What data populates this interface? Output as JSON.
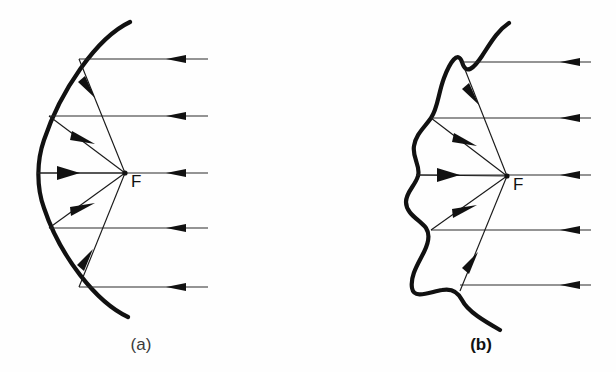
{
  "figure": {
    "background_color": "#fefefe",
    "ink_color": "#111111",
    "width": 616,
    "height": 372
  },
  "panels": [
    {
      "id": "panel-a",
      "caption": "(a)",
      "caption_x": 141,
      "caption_y": 350,
      "caption_bold": false,
      "mirror_type": "smooth-parabolic",
      "mirror_stroke_width": 4.2,
      "focus": {
        "label": "F",
        "x": 125,
        "y": 173,
        "label_x": 131,
        "label_y": 187,
        "dot_radius": 2.6
      },
      "axis_x_left": 37,
      "ray_x_right": 208,
      "arrow_tip_x": 166,
      "rays": [
        {
          "y": 59,
          "hit_x": 79,
          "hit_y": 59
        },
        {
          "y": 116,
          "hit_x": 49,
          "hit_y": 116
        },
        {
          "y": 173,
          "hit_x": 37,
          "hit_y": 173
        },
        {
          "y": 228,
          "hit_x": 49,
          "hit_y": 228
        },
        {
          "y": 287,
          "hit_x": 79,
          "hit_y": 287
        }
      ],
      "curve_path": "M 130 22 C 96 38 60 92 44 140 C 37 160 36 186 44 208 C 60 256 96 302 128 317"
    },
    {
      "id": "panel-b",
      "caption": "(b)",
      "caption_x": 481,
      "caption_y": 350,
      "caption_bold": true,
      "mirror_type": "irregular-wavy",
      "mirror_stroke_width": 4.2,
      "focus": {
        "label": "F",
        "x": 507,
        "y": 176,
        "label_x": 513,
        "label_y": 190,
        "dot_radius": 2.6
      },
      "axis_x_left": 415,
      "ray_x_right": 591,
      "arrow_tip_x": 560,
      "rays": [
        {
          "y": 62,
          "hit_x": 462,
          "hit_y": 62
        },
        {
          "y": 118,
          "hit_x": 431,
          "hit_y": 118
        },
        {
          "y": 175,
          "hit_x": 416,
          "hit_y": 175
        },
        {
          "y": 230,
          "hit_x": 431,
          "hit_y": 230
        },
        {
          "y": 285,
          "hit_x": 460,
          "hit_y": 285
        }
      ],
      "curve_path": "M 509 23 C 497 31 490 44 482 56 C 474 68 466 76 462 62 C 458 50 450 62 444 78 C 438 94 438 108 431 118 C 424 128 416 134 414 146 C 412 158 421 166 418 176 C 415 186 406 192 406 202 C 406 214 420 220 426 228 C 430 234 429 242 424 252 C 418 264 410 276 412 288 C 414 300 430 292 442 290 C 452 288 458 292 462 300 C 468 312 486 322 500 330"
    }
  ],
  "icons": {
    "arrow": "arrow-head",
    "focus_point": "focus-dot"
  }
}
